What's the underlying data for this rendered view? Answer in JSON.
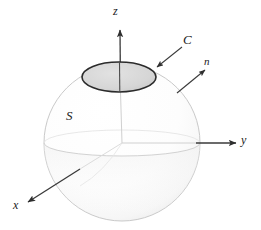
{
  "figure": {
    "type": "3d-geometry-diagram",
    "background_color": "#ffffff",
    "width": 261,
    "height": 230,
    "axes": [
      {
        "id": "z",
        "label": "z",
        "direction": "up",
        "from": [
          122,
          143
        ],
        "to": [
          120,
          27
        ],
        "label_pos": [
          118,
          12
        ]
      },
      {
        "id": "y",
        "label": "y",
        "direction": "right",
        "from": [
          122,
          143
        ],
        "to": [
          237,
          143
        ],
        "label_pos": [
          245,
          142
        ]
      },
      {
        "id": "x",
        "label": "x",
        "direction": "down-left",
        "from": [
          122,
          143
        ],
        "to": [
          27,
          203
        ],
        "label_pos": [
          17,
          207
        ]
      }
    ],
    "annotations": [
      {
        "id": "C",
        "label": "C",
        "meaning": "boundary curve of the cap",
        "label_pos": [
          188,
          42
        ],
        "leader_from": [
          183,
          46
        ],
        "leader_to": [
          155,
          68
        ]
      },
      {
        "id": "n",
        "label": "n",
        "meaning": "outward unit normal vector",
        "label_pos": [
          208,
          63
        ],
        "arrow_from": [
          178,
          92
        ],
        "arrow_to": [
          204,
          70
        ]
      },
      {
        "id": "S",
        "label": "S",
        "meaning": "the surface",
        "label_pos": [
          70,
          118
        ]
      }
    ],
    "sphere": {
      "center": [
        122,
        143
      ],
      "radius": 78,
      "outline_color": "#c9c9c9",
      "fill_color": "#fdfdfd"
    },
    "equator": {
      "center": [
        122,
        143
      ],
      "rx": 78,
      "ry": 13,
      "color": "#d5d5d5"
    },
    "cap_ellipse": {
      "center": [
        119,
        77
      ],
      "rx": 37,
      "ry": 15,
      "fill_color": "#d4d4d4",
      "stroke_color": "#2b2b2b",
      "stroke_width": 1.6
    },
    "colors": {
      "line": "#3a3a3a",
      "faint_line": "#cfcfcf",
      "cap_fill": "#d4d4d4",
      "label": "#1a1a1a"
    }
  }
}
